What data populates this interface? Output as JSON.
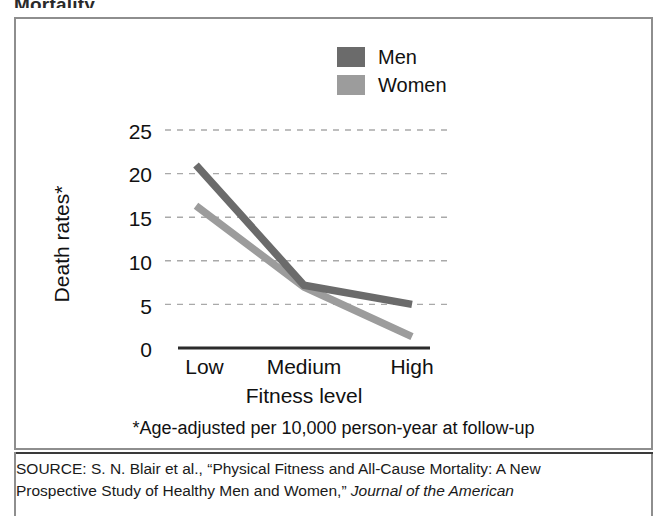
{
  "figure": {
    "title_crop": "Mortality",
    "footnote": "*Age-adjusted per 10,000 person-year at follow-up"
  },
  "legend": {
    "position": "top-center",
    "items": [
      {
        "label": "Men",
        "color": "#6b6b6b",
        "name": "legend-swatch-men"
      },
      {
        "label": "Women",
        "color": "#9c9c9c",
        "name": "legend-swatch-women"
      }
    ]
  },
  "axes": {
    "ylabel": "Death rates*",
    "xlabel": "Fitness level",
    "yticks": [
      "25",
      "20",
      "15",
      "10",
      "5",
      "0"
    ],
    "xticks": [
      "Low",
      "Medium",
      "High"
    ]
  },
  "source": {
    "line1_prefix": "SOURCE: S. N. Blair et al., “Physical Fitness and All-Cause Mortality: A New",
    "line2_prefix": "Prospective Study of Healthy Men and Women,” ",
    "line2_italic": "Journal of the American"
  },
  "chart_data": {
    "type": "line",
    "title": "Mortality",
    "xlabel": "Fitness level",
    "ylabel": "Death rates*",
    "categories": [
      "Low",
      "Medium",
      "High"
    ],
    "series": [
      {
        "name": "Men",
        "values": [
          21.0,
          7.2,
          5.0
        ],
        "color": "#6b6b6b"
      },
      {
        "name": "Women",
        "values": [
          16.3,
          7.0,
          1.3
        ],
        "color": "#9c9c9c"
      }
    ],
    "ylim": [
      0,
      25
    ],
    "yticks": [
      0,
      5,
      10,
      15,
      20,
      25
    ],
    "grid": "horizontal-dashed",
    "legend_position": "top-center",
    "note": "*Age-adjusted per 10,000 person-year at follow-up"
  }
}
